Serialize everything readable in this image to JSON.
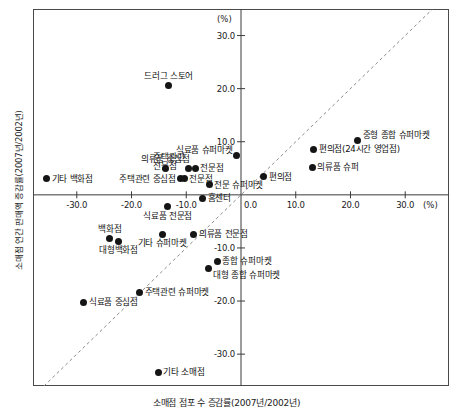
{
  "chart_data": {
    "type": "scatter",
    "title": "",
    "xlabel": "소매점 점포 수 증감률(2007년/2002년)",
    "ylabel": "소매점 연간 판매액 증감률(2007년/2002년)",
    "x_unit": "(%)",
    "y_unit": "(%)",
    "xlim": [
      -38.0,
      38.0
    ],
    "ylim": [
      -36.0,
      35.0
    ],
    "xticks": [
      "-30.0",
      "-20.0",
      "-10.0",
      "0.0",
      "10.0",
      "20.0",
      "30.0"
    ],
    "xtick_values": [
      -30.0,
      -20.0,
      -10.0,
      0.0,
      10.0,
      20.0,
      30.0
    ],
    "yticks": [
      "30.0",
      "20.0",
      "10.0",
      "0.0",
      "-10.0",
      "-20.0",
      "-30.0"
    ],
    "ytick_values": [
      30.0,
      20.0,
      10.0,
      0.0,
      -10.0,
      -20.0,
      -30.0
    ],
    "grid": false,
    "legend": "none",
    "reference_line": {
      "type": "diagonal-dashed",
      "description": "y = x 대각 점선"
    },
    "points": [
      {
        "label": "기타 백화점",
        "x": -35.5,
        "y": 3.0,
        "anchor": "left"
      },
      {
        "label": "드러그 스토어",
        "x": -13.2,
        "y": 20.6,
        "anchor": "center-above"
      },
      {
        "label": "의류품 중심점",
        "x": -13.8,
        "y": 5.0,
        "anchor": "center-above"
      },
      {
        "label": "주택관련 중심점",
        "x": -11.0,
        "y": 3.0,
        "anchor": "right"
      },
      {
        "label": "주택관련\n전문점",
        "x": -9.6,
        "y": 5.0,
        "anchor": "right-above"
      },
      {
        "label": "전문점",
        "x": -8.4,
        "y": 5.0,
        "anchor": "left"
      },
      {
        "label": "전문점",
        "x": -10.4,
        "y": 3.0,
        "anchor": "left"
      },
      {
        "label": "전문 슈퍼마켓",
        "x": -5.8,
        "y": 1.9,
        "anchor": "left"
      },
      {
        "label": "홈센터",
        "x": -7.0,
        "y": -0.6,
        "anchor": "left"
      },
      {
        "label": "식료품 전문점",
        "x": -13.4,
        "y": -2.2,
        "anchor": "center-below"
      },
      {
        "label": "의류품 전문점",
        "x": -8.6,
        "y": -7.4,
        "anchor": "left"
      },
      {
        "label": "기타 슈퍼마켓",
        "x": -14.4,
        "y": -7.4,
        "anchor": "center-below"
      },
      {
        "label": "백화점",
        "x": -24.0,
        "y": -8.2,
        "anchor": "center-above"
      },
      {
        "label": "대형백화점",
        "x": -22.4,
        "y": -8.7,
        "anchor": "center-below"
      },
      {
        "label": "종합 슈퍼마켓",
        "x": -4.3,
        "y": -12.5,
        "anchor": "left"
      },
      {
        "label": "대형 종합 슈퍼마켓",
        "x": -6.0,
        "y": -13.8,
        "anchor": "left-below"
      },
      {
        "label": "주택관련 슈퍼마켓",
        "x": -18.5,
        "y": -18.3,
        "anchor": "left"
      },
      {
        "label": "식료품 중심점",
        "x": -28.7,
        "y": -20.2,
        "anchor": "left"
      },
      {
        "label": "기타 소매점",
        "x": -15.1,
        "y": -33.4,
        "anchor": "left"
      },
      {
        "label": "식료품 슈퍼마켓",
        "x": -0.8,
        "y": 7.4,
        "anchor": "right-above"
      },
      {
        "label": "편의점",
        "x": 4.2,
        "y": 3.4,
        "anchor": "right-below"
      },
      {
        "label": "편의점(24시간 영업점)",
        "x": 13.3,
        "y": 8.6,
        "anchor": "left"
      },
      {
        "label": "의류품 슈퍼",
        "x": 13.0,
        "y": 5.2,
        "anchor": "left"
      },
      {
        "label": "중형 종합 슈퍼마켓",
        "x": 21.3,
        "y": 10.3,
        "anchor": "left-above"
      }
    ]
  }
}
